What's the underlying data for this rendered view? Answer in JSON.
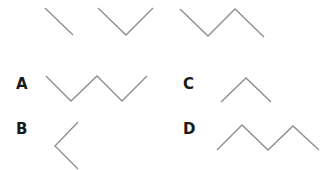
{
  "diagram": {
    "stroke_color": "#8c8c8c",
    "sequence": [
      {
        "id": "seq-1",
        "points": [
          [
            45,
            8
          ],
          [
            73,
            35
          ]
        ]
      },
      {
        "id": "seq-2",
        "points": [
          [
            98,
            8
          ],
          [
            126,
            35
          ],
          [
            153,
            8
          ]
        ]
      },
      {
        "id": "seq-3",
        "points": [
          [
            180,
            9
          ],
          [
            208,
            36
          ],
          [
            235,
            9
          ],
          [
            264,
            37
          ]
        ]
      }
    ],
    "options": [
      {
        "label": "A",
        "label_pos": [
          16,
          77
        ],
        "points": [
          [
            46,
            76
          ],
          [
            71,
            101
          ],
          [
            97,
            76
          ],
          [
            122,
            101
          ],
          [
            147,
            76
          ]
        ]
      },
      {
        "label": "B",
        "label_pos": [
          16,
          122
        ],
        "points": [
          [
            78,
            122
          ],
          [
            55,
            146
          ],
          [
            78,
            169
          ]
        ]
      },
      {
        "label": "C",
        "label_pos": [
          183,
          77
        ],
        "points": [
          [
            221,
            102
          ],
          [
            246,
            78
          ],
          [
            271,
            102
          ]
        ]
      },
      {
        "label": "D",
        "label_pos": [
          183,
          122
        ],
        "points": [
          [
            217,
            150
          ],
          [
            242,
            125
          ],
          [
            268,
            150
          ],
          [
            293,
            126
          ],
          [
            319,
            150
          ]
        ]
      }
    ]
  }
}
